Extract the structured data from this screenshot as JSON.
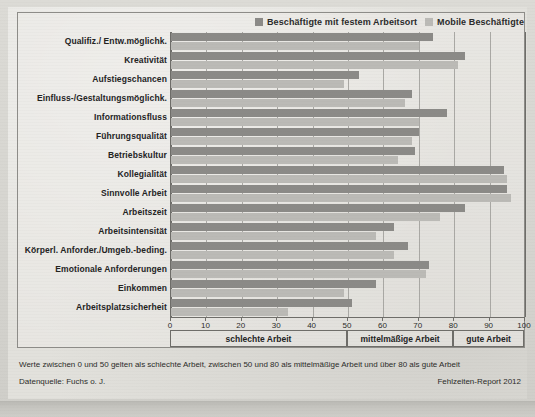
{
  "legend": {
    "items": [
      {
        "label": "Beschäftigte mit festem Arbeitsort",
        "color": "#8b8a87"
      },
      {
        "label": "Mobile Beschäftigte",
        "color": "#bbbab6"
      }
    ]
  },
  "footnotes": {
    "note": "Werte zwischen 0 und 50 gelten als schlechte Arbeit, zwischen 50 und 80 als mittelmäßige Arbeit und über 80 als gute Arbeit",
    "source": "Datenquelle: Fuchs o. J.",
    "report": "Fehlzeiten-Report 2012"
  },
  "zones": [
    {
      "label": "schlechte Arbeit",
      "from": 0,
      "to": 50
    },
    {
      "label": "mittelmäßige Arbeit",
      "from": 50,
      "to": 80
    },
    {
      "label": "gute Arbeit",
      "from": 80,
      "to": 100
    }
  ],
  "chart_data": {
    "type": "bar",
    "title": "",
    "xlabel": "",
    "ylabel": "",
    "xlim": [
      0,
      100
    ],
    "xticks": [
      0,
      10,
      20,
      30,
      40,
      50,
      60,
      70,
      80,
      90,
      100
    ],
    "grid": true,
    "orientation": "horizontal",
    "legend_position": "top-right",
    "categories": [
      "Qualifiz./ Entw.möglichk.",
      "Kreativität",
      "Aufstiegschancen",
      "Einfluss-/Gestaltungsmöglichk.",
      "Informationsfluss",
      "Führungsqualität",
      "Betriebskultur",
      "Kollegialität",
      "Sinnvolle Arbeit",
      "Arbeitszeit",
      "Arbeitsintensität",
      "Körperl. Anforder./Umgeb.-beding.",
      "Emotionale Anforderungen",
      "Einkommen",
      "Arbeitsplatzsicherheit"
    ],
    "series": [
      {
        "name": "Beschäftigte mit festem Arbeitsort",
        "color": "#8b8a87",
        "values": [
          74,
          83,
          53,
          68,
          78,
          70,
          69,
          94,
          95,
          83,
          63,
          67,
          73,
          58,
          51
        ]
      },
      {
        "name": "Mobile Beschäftigte",
        "color": "#bbbab6",
        "values": [
          70,
          81,
          49,
          66,
          70,
          68,
          64,
          95,
          96,
          76,
          58,
          63,
          72,
          49,
          33
        ]
      }
    ]
  }
}
